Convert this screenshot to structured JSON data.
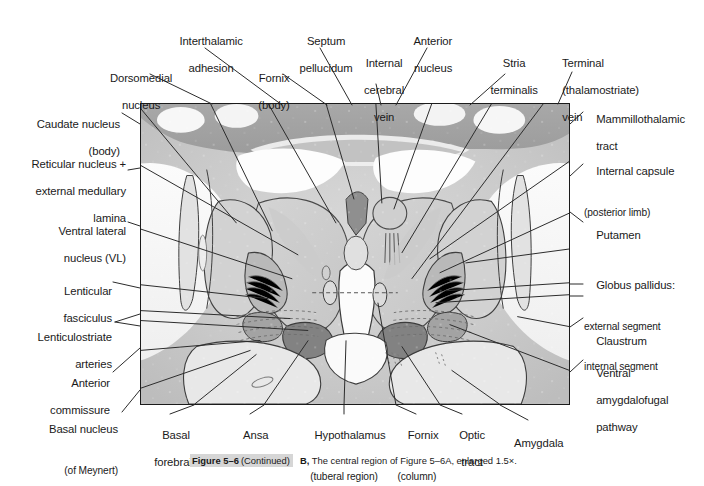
{
  "figure": {
    "caption_figure_number": "Figure 5–6",
    "caption_continued": "(Continued)",
    "caption_part": "B,",
    "caption_text": "The central region of Figure 5–6A, enlarged 1.5×.",
    "panel_description": "Coronal histological section of the central brain region showing thalamus, basal ganglia and hypothalamus"
  },
  "labels": {
    "top": [
      {
        "id": "interthalamic-adhesion",
        "line1": "Interthalamic",
        "line2": "adhesion"
      },
      {
        "id": "septum-pellucidum",
        "line1": "Septum",
        "line2": "pellucidum"
      },
      {
        "id": "anterior-nucleus",
        "line1": "Anterior",
        "line2": "nucleus"
      },
      {
        "id": "dorsomedial-nucleus",
        "line1": "Dorsomedial",
        "line2": "nucleus"
      },
      {
        "id": "fornix-body",
        "line1": "Fornix",
        "line2": "(body)"
      },
      {
        "id": "internal-cerebral-vein",
        "line1": "Internal",
        "line2": "cerebral",
        "line3": "vein"
      },
      {
        "id": "stria-terminalis",
        "line1": "Stria",
        "line2": "terminalis"
      },
      {
        "id": "terminal-thalamostriate-vein",
        "line1": "Terminal",
        "line2": "(thalamostriate)",
        "line3": "vein"
      }
    ],
    "left": [
      {
        "id": "caudate-nucleus",
        "line1": "Caudate nucleus",
        "line2": "(body)"
      },
      {
        "id": "reticular-nucleus",
        "line1": "Reticular nucleus +",
        "line2": "external medullary",
        "line3": "lamina"
      },
      {
        "id": "ventral-lateral-nucleus",
        "line1": "Ventral lateral",
        "line2": "nucleus (VL)"
      },
      {
        "id": "lenticular-fasciculus",
        "line1": "Lenticular",
        "line2": "fasciculus"
      },
      {
        "id": "lenticulostriate-arteries",
        "line1": "Lenticulostriate",
        "line2": "arteries"
      },
      {
        "id": "anterior-commissure",
        "line1": "Anterior",
        "line2": "commissure"
      },
      {
        "id": "basal-nucleus-meynert",
        "line1": "Basal nucleus",
        "line2": "(of Meynert)"
      }
    ],
    "right": [
      {
        "id": "mammillothalamic-tract",
        "line1": "Mammillothalamic",
        "line2": "tract"
      },
      {
        "id": "internal-capsule",
        "line1": "Internal capsule",
        "line2": "(posterior limb)"
      },
      {
        "id": "putamen",
        "line1": "Putamen"
      },
      {
        "id": "globus-pallidus",
        "line1": "Globus pallidus:",
        "line2": "external segment",
        "line3": "internal segment"
      },
      {
        "id": "claustrum",
        "line1": "Claustrum"
      },
      {
        "id": "ventral-amygdalofugal-pathway",
        "line1": "Ventral",
        "line2": "amygdalofugal",
        "line3": "pathway"
      }
    ],
    "bottom": [
      {
        "id": "basal-forebrain",
        "line1": "Basal",
        "line2": "forebrain"
      },
      {
        "id": "ansa-lenticularis",
        "line1": "Ansa",
        "line2": "lenticularis"
      },
      {
        "id": "hypothalamus",
        "line1": "Hypothalamus",
        "line2": "(tuberal region)"
      },
      {
        "id": "fornix-column",
        "line1": "Fornix",
        "line2": "(column)"
      },
      {
        "id": "optic-tract",
        "line1": "Optic",
        "line2": "tract"
      },
      {
        "id": "amygdala",
        "line1": "Amygdala"
      }
    ]
  },
  "colors": {
    "text": "#1a1a1a",
    "leader_line": "#2b2b2b",
    "panel_border": "#1b1b1b",
    "tissue_light": "#e3e3e3",
    "tissue_mid": "#c2c2c2",
    "tissue_dark": "#9a9a9a",
    "tract_dark": "#7c7c7c",
    "white_matter": "#f6f6f6",
    "caption_highlight": "#d6d6d6"
  }
}
